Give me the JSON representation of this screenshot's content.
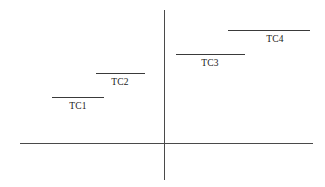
{
  "figure": {
    "background_color": "#ffffff",
    "axis_color": "#4a4a4a",
    "segment_color": "#3a3a3a",
    "label_color": "#1a1a1a"
  },
  "axes": {
    "horizontal": {
      "x1": 20,
      "x2": 313,
      "y": 143
    },
    "vertical": {
      "x": 164,
      "y1": 10,
      "y2": 180
    }
  },
  "chart_data": {
    "type": "scatter",
    "title": "",
    "xlabel": "",
    "ylabel": "",
    "grid": false,
    "legend": "none",
    "note": "Four horizontal level segments arranged in an ascending staircase across a two-axis (crosshair) coordinate frame. Each segment is annotated with its name below it.",
    "segments": [
      {
        "label": "TC1",
        "x_start": 52,
        "x_end": 104,
        "y": 97,
        "label_x": 78,
        "label_y": 101
      },
      {
        "label": "TC2",
        "x_start": 96,
        "x_end": 145,
        "y": 73,
        "label_x": 120,
        "label_y": 77
      },
      {
        "label": "TC3",
        "x_start": 176,
        "x_end": 245,
        "y": 54,
        "label_x": 210,
        "label_y": 58
      },
      {
        "label": "TC4",
        "x_start": 228,
        "x_end": 310,
        "y": 30,
        "label_x": 275,
        "label_y": 34
      }
    ]
  }
}
